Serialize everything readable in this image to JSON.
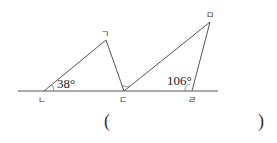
{
  "diagram": {
    "points": {
      "g": {
        "label": "ㄱ",
        "x": 106,
        "y": 40
      },
      "n": {
        "label": "ㄴ",
        "x": 44,
        "y": 91
      },
      "d": {
        "label": "ㄷ",
        "x": 124,
        "y": 91
      },
      "r": {
        "label": "ㄹ",
        "x": 192,
        "y": 91
      },
      "m": {
        "label": "ㅁ",
        "x": 210,
        "y": 22
      }
    },
    "angles": {
      "n_angle": "38°",
      "r_angle": "106°"
    },
    "baseline": {
      "x1": 18,
      "x2": 218,
      "y": 91
    }
  },
  "answer": {
    "open": "(",
    "close": ")"
  }
}
